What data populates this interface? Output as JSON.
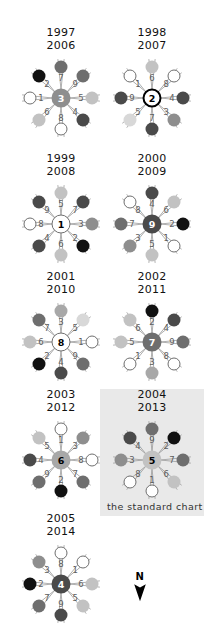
{
  "figure": {
    "caption": "the standard chart",
    "north_label": "N",
    "north_icon": "north-arrow-down-icon",
    "highlight_color": "#e9e9e9",
    "background_color": "#ffffff"
  },
  "chart_data": {
    "type": "scatter",
    "title": "",
    "subtitle": "",
    "xlabel": "",
    "ylabel": "",
    "legend": [],
    "notes": [
      "Nine radial rosette charts; each rosette has a numbered central hub and eight spokes.",
      "Each spoke carries a sector number label and a shaded circular marker.",
      "Marker fill tone encodes magnitude: black = darkest, white/outline = lightest.",
      "The 2004 / 2013 rosette is highlighted and annotated as the standard chart."
    ],
    "marker_tones": {
      "black": "#111111",
      "dark": "#4a4a4a",
      "medium_dark": "#6e6e6e",
      "medium": "#8e8e8e",
      "medium_light": "#a8a8a8",
      "light": "#c2c2c2",
      "very_light": "#d8d8d8",
      "white": "#ffffff"
    },
    "directions_deg": [
      90,
      45,
      0,
      315,
      270,
      225,
      180,
      135
    ],
    "rosettes": [
      {
        "id": "rosette-1997-2006",
        "years": [
          "1997",
          "2006"
        ],
        "hub": {
          "value": "3",
          "fill": "#8e8e8e",
          "text_color": "#ffffff",
          "ring": false
        },
        "spokes": [
          {
            "label": "7",
            "angle_deg": 90,
            "fill": "#6e6e6e"
          },
          {
            "label": "9",
            "angle_deg": 45,
            "fill": "#6e6e6e"
          },
          {
            "label": "5",
            "angle_deg": 0,
            "fill": "#c2c2c2"
          },
          {
            "label": "4",
            "angle_deg": 315,
            "fill": "#4a4a4a"
          },
          {
            "label": "8",
            "angle_deg": 270,
            "fill": "#ffffff"
          },
          {
            "label": "6",
            "angle_deg": 225,
            "fill": "#c2c2c2"
          },
          {
            "label": "1",
            "angle_deg": 180,
            "fill": "#ffffff"
          },
          {
            "label": "2",
            "angle_deg": 135,
            "fill": "#111111"
          }
        ]
      },
      {
        "id": "rosette-1998-2007",
        "years": [
          "1998",
          "2007"
        ],
        "hub": {
          "value": "2",
          "fill": "#ffffff",
          "text_color": "#000000",
          "ring": true
        },
        "spokes": [
          {
            "label": "6",
            "angle_deg": 90,
            "fill": "#c2c2c2"
          },
          {
            "label": "8",
            "angle_deg": 45,
            "fill": "#ffffff"
          },
          {
            "label": "4",
            "angle_deg": 0,
            "fill": "#4a4a4a"
          },
          {
            "label": "3",
            "angle_deg": 315,
            "fill": "#8e8e8e"
          },
          {
            "label": "7",
            "angle_deg": 270,
            "fill": "#4a4a4a"
          },
          {
            "label": "5",
            "angle_deg": 225,
            "fill": "#d8d8d8"
          },
          {
            "label": "9",
            "angle_deg": 180,
            "fill": "#4a4a4a"
          },
          {
            "label": "1",
            "angle_deg": 135,
            "fill": "#ffffff"
          }
        ]
      },
      {
        "id": "rosette-1999-2008",
        "years": [
          "1999",
          "2008"
        ],
        "hub": {
          "value": "1",
          "fill": "#ffffff",
          "text_color": "#000000",
          "ring": false
        },
        "spokes": [
          {
            "label": "5",
            "angle_deg": 90,
            "fill": "#c2c2c2"
          },
          {
            "label": "7",
            "angle_deg": 45,
            "fill": "#4a4a4a"
          },
          {
            "label": "3",
            "angle_deg": 0,
            "fill": "#8e8e8e"
          },
          {
            "label": "2",
            "angle_deg": 315,
            "fill": "#111111"
          },
          {
            "label": "6",
            "angle_deg": 270,
            "fill": "#c2c2c2"
          },
          {
            "label": "4",
            "angle_deg": 225,
            "fill": "#4a4a4a"
          },
          {
            "label": "8",
            "angle_deg": 180,
            "fill": "#ffffff"
          },
          {
            "label": "9",
            "angle_deg": 135,
            "fill": "#4a4a4a"
          }
        ]
      },
      {
        "id": "rosette-2000-2009",
        "years": [
          "2000",
          "2009"
        ],
        "hub": {
          "value": "9",
          "fill": "#4a4a4a",
          "text_color": "#ffffff",
          "ring": false
        },
        "spokes": [
          {
            "label": "4",
            "angle_deg": 90,
            "fill": "#4a4a4a"
          },
          {
            "label": "6",
            "angle_deg": 45,
            "fill": "#c2c2c2"
          },
          {
            "label": "2",
            "angle_deg": 0,
            "fill": "#111111"
          },
          {
            "label": "1",
            "angle_deg": 315,
            "fill": "#ffffff"
          },
          {
            "label": "5",
            "angle_deg": 270,
            "fill": "#c2c2c2"
          },
          {
            "label": "3",
            "angle_deg": 225,
            "fill": "#8e8e8e"
          },
          {
            "label": "7",
            "angle_deg": 180,
            "fill": "#6e6e6e"
          },
          {
            "label": "8",
            "angle_deg": 135,
            "fill": "#ffffff"
          }
        ]
      },
      {
        "id": "rosette-2001-2010",
        "years": [
          "2001",
          "2010"
        ],
        "hub": {
          "value": "8",
          "fill": "#ffffff",
          "text_color": "#000000",
          "ring": false
        },
        "spokes": [
          {
            "label": "3",
            "angle_deg": 90,
            "fill": "#a8a8a8"
          },
          {
            "label": "5",
            "angle_deg": 45,
            "fill": "#d8d8d8"
          },
          {
            "label": "1",
            "angle_deg": 0,
            "fill": "#ffffff"
          },
          {
            "label": "9",
            "angle_deg": 315,
            "fill": "#6e6e6e"
          },
          {
            "label": "4",
            "angle_deg": 270,
            "fill": "#4a4a4a"
          },
          {
            "label": "2",
            "angle_deg": 225,
            "fill": "#111111"
          },
          {
            "label": "6",
            "angle_deg": 180,
            "fill": "#c2c2c2"
          },
          {
            "label": "7",
            "angle_deg": 135,
            "fill": "#6e6e6e"
          }
        ]
      },
      {
        "id": "rosette-2002-2011",
        "years": [
          "2002",
          "2011"
        ],
        "hub": {
          "value": "7",
          "fill": "#6e6e6e",
          "text_color": "#ffffff",
          "ring": false
        },
        "spokes": [
          {
            "label": "2",
            "angle_deg": 90,
            "fill": "#111111"
          },
          {
            "label": "4",
            "angle_deg": 45,
            "fill": "#4a4a4a"
          },
          {
            "label": "9",
            "angle_deg": 0,
            "fill": "#6e6e6e"
          },
          {
            "label": "8",
            "angle_deg": 315,
            "fill": "#ffffff"
          },
          {
            "label": "3",
            "angle_deg": 270,
            "fill": "#a8a8a8"
          },
          {
            "label": "1",
            "angle_deg": 225,
            "fill": "#ffffff"
          },
          {
            "label": "5",
            "angle_deg": 180,
            "fill": "#c2c2c2"
          },
          {
            "label": "6",
            "angle_deg": 135,
            "fill": "#c2c2c2"
          }
        ]
      },
      {
        "id": "rosette-2003-2012",
        "years": [
          "2003",
          "2012"
        ],
        "hub": {
          "value": "6",
          "fill": "#a8a8a8",
          "text_color": "#000000",
          "ring": false
        },
        "spokes": [
          {
            "label": "1",
            "angle_deg": 90,
            "fill": "#ffffff"
          },
          {
            "label": "3",
            "angle_deg": 45,
            "fill": "#8e8e8e"
          },
          {
            "label": "8",
            "angle_deg": 0,
            "fill": "#ffffff"
          },
          {
            "label": "7",
            "angle_deg": 315,
            "fill": "#6e6e6e"
          },
          {
            "label": "2",
            "angle_deg": 270,
            "fill": "#111111"
          },
          {
            "label": "9",
            "angle_deg": 225,
            "fill": "#6e6e6e"
          },
          {
            "label": "4",
            "angle_deg": 180,
            "fill": "#4a4a4a"
          },
          {
            "label": "5",
            "angle_deg": 135,
            "fill": "#c2c2c2"
          }
        ]
      },
      {
        "id": "rosette-2004-2013",
        "years": [
          "2004",
          "2013"
        ],
        "standard": true,
        "hub": {
          "value": "5",
          "fill": "#c2c2c2",
          "text_color": "#000000",
          "ring": false
        },
        "spokes": [
          {
            "label": "9",
            "angle_deg": 90,
            "fill": "#6e6e6e"
          },
          {
            "label": "2",
            "angle_deg": 45,
            "fill": "#111111"
          },
          {
            "label": "7",
            "angle_deg": 0,
            "fill": "#6e6e6e"
          },
          {
            "label": "6",
            "angle_deg": 315,
            "fill": "#c2c2c2"
          },
          {
            "label": "1",
            "angle_deg": 270,
            "fill": "#ffffff"
          },
          {
            "label": "8",
            "angle_deg": 225,
            "fill": "#ffffff"
          },
          {
            "label": "3",
            "angle_deg": 180,
            "fill": "#8e8e8e"
          },
          {
            "label": "4",
            "angle_deg": 135,
            "fill": "#4a4a4a"
          }
        ]
      },
      {
        "id": "rosette-2005-2014",
        "years": [
          "2005",
          "2014"
        ],
        "hub": {
          "value": "4",
          "fill": "#4a4a4a",
          "text_color": "#ffffff",
          "ring": false
        },
        "spokes": [
          {
            "label": "8",
            "angle_deg": 90,
            "fill": "#ffffff"
          },
          {
            "label": "1",
            "angle_deg": 45,
            "fill": "#ffffff"
          },
          {
            "label": "6",
            "angle_deg": 0,
            "fill": "#c2c2c2"
          },
          {
            "label": "5",
            "angle_deg": 315,
            "fill": "#c2c2c2"
          },
          {
            "label": "9",
            "angle_deg": 270,
            "fill": "#4a4a4a"
          },
          {
            "label": "7",
            "angle_deg": 225,
            "fill": "#6e6e6e"
          },
          {
            "label": "2",
            "angle_deg": 180,
            "fill": "#111111"
          },
          {
            "label": "3",
            "angle_deg": 135,
            "fill": "#8e8e8e"
          }
        ]
      }
    ]
  },
  "layout": {
    "positions": [
      {
        "left": 10,
        "top": 26
      },
      {
        "left": 101,
        "top": 26
      },
      {
        "left": 10,
        "top": 152
      },
      {
        "left": 101,
        "top": 152
      },
      {
        "left": 10,
        "top": 270
      },
      {
        "left": 101,
        "top": 270
      },
      {
        "left": 10,
        "top": 388
      },
      {
        "left": 101,
        "top": 388
      },
      {
        "left": 10,
        "top": 512
      }
    ],
    "highlight": {
      "left": 100,
      "top": 389,
      "width": 104,
      "height": 127
    },
    "caption_pos": {
      "left": 107,
      "top": 501
    },
    "north_pos": {
      "left": 132,
      "top": 572
    }
  }
}
